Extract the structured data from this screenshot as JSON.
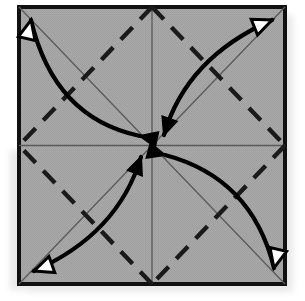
{
  "figure": {
    "kind": "origami-diagram",
    "canvas": {
      "width": 305,
      "height": 301
    }
  },
  "colors": {
    "paper_fill": "#a9a9a9",
    "paper_border": "#111111",
    "crease_line": "#5a5a5a",
    "dashed_crease": "#1a1a1a",
    "arrow_stroke": "#000000",
    "arrowhead_solid_fill": "#000000",
    "arrowhead_hollow_fill": "#ffffff",
    "shadow": "#d8d8d8",
    "background": "#ffffff"
  },
  "sheet": {
    "label": "paper-square",
    "x": 19,
    "y": 7,
    "width": 266,
    "height": 277,
    "border_width": 4,
    "corners": {
      "top_left": [
        19,
        7
      ],
      "top_right": [
        285,
        7
      ],
      "bottom_right": [
        285,
        284
      ],
      "bottom_left": [
        19,
        284
      ]
    },
    "center": [
      152,
      145.5
    ],
    "edge_midpoints": {
      "top": [
        152,
        7
      ],
      "right": [
        285,
        145.5
      ],
      "bottom": [
        152,
        284
      ],
      "left": [
        19,
        145.5
      ]
    }
  },
  "shadow": {
    "label": "drop-shadow",
    "offset_x": 8,
    "offset_y": 8,
    "opacity": 0.55
  },
  "creases": {
    "solid": [
      {
        "name": "diagonal-tl-br",
        "from": [
          19,
          7
        ],
        "to": [
          285,
          284
        ],
        "style": "valley-thin"
      },
      {
        "name": "diagonal-tr-bl",
        "from": [
          285,
          7
        ],
        "to": [
          19,
          284
        ],
        "style": "valley-thin"
      },
      {
        "name": "center-vertical",
        "from": [
          152,
          7
        ],
        "to": [
          152,
          284
        ],
        "style": "valley-thin"
      },
      {
        "name": "center-horizontal",
        "from": [
          19,
          145.5
        ],
        "to": [
          285,
          145.5
        ],
        "style": "valley-thin"
      }
    ],
    "dashed": [
      {
        "name": "dashed-top-left",
        "from": [
          152,
          7
        ],
        "to": [
          19,
          145.5
        ],
        "style": "mountain-dashed"
      },
      {
        "name": "dashed-top-right",
        "from": [
          152,
          7
        ],
        "to": [
          285,
          145.5
        ],
        "style": "mountain-dashed"
      },
      {
        "name": "dashed-bottom-right",
        "from": [
          285,
          145.5
        ],
        "to": [
          152,
          284
        ],
        "style": "mountain-dashed"
      },
      {
        "name": "dashed-bottom-left",
        "from": [
          152,
          284
        ],
        "to": [
          19,
          145.5
        ],
        "style": "mountain-dashed"
      }
    ],
    "dash_pattern": "17 11",
    "dash_width": 4.4,
    "solid_width": 1.3
  },
  "arrows": [
    {
      "name": "arrow-corner-top-left",
      "description": "Double-headed curved arrow from the center to the top-left corner.",
      "path": "M 140 136 Q 54 118 31 20",
      "head_at_center": {
        "point": [
          140,
          136
        ],
        "angle": 192,
        "fill": "solid"
      },
      "head_at_corner": {
        "point": [
          31,
          20
        ],
        "angle": 283,
        "fill": "hollow"
      },
      "stroke_width": 4.2
    },
    {
      "name": "arrow-corner-top-right",
      "description": "Double-headed curved arrow from the center to the top-right corner.",
      "path": "M 164 135 Q 186 58 272 20",
      "head_at_center": {
        "point": [
          164,
          135
        ],
        "angle": 109,
        "fill": "solid"
      },
      "head_at_corner": {
        "point": [
          272,
          20
        ],
        "angle": 338,
        "fill": "hollow"
      },
      "stroke_width": 4.2
    },
    {
      "name": "arrow-corner-bottom-right",
      "description": "Double-headed curved arrow from the center to the bottom-right corner.",
      "path": "M 165 155 Q 252 178 274 268",
      "head_at_center": {
        "point": [
          165,
          155
        ],
        "angle": 15,
        "fill": "solid"
      },
      "head_at_corner": {
        "point": [
          274,
          268
        ],
        "angle": 103,
        "fill": "hollow"
      },
      "stroke_width": 4.2
    },
    {
      "name": "arrow-corner-bottom-left",
      "description": "Double-headed curved arrow from the center to the bottom-left corner.",
      "path": "M 141 157 Q 118 234 34 271",
      "head_at_center": {
        "point": [
          141,
          157
        ],
        "angle": 291,
        "fill": "solid"
      },
      "head_at_corner": {
        "point": [
          34,
          271
        ],
        "angle": 160,
        "fill": "hollow"
      },
      "stroke_width": 4.2
    }
  ]
}
